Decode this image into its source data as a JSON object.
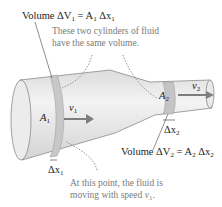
{
  "diagram": {
    "top_label": {
      "prefix": "Volume ΔV",
      "sub": "1",
      "eq": " = A",
      "sub2": "1",
      "tail": " Δx",
      "sub3": "1"
    },
    "top_note": [
      "These two cylinders of fluid",
      "have the same volume."
    ],
    "area_1": {
      "text": "A",
      "sub": "1"
    },
    "area_2": {
      "text": "A",
      "sub": "2"
    },
    "velocity_1": {
      "text": "v",
      "sub": "1"
    },
    "velocity_2": {
      "text": "v",
      "sub": "2"
    },
    "dx_1": {
      "text": "Δx",
      "sub": "1"
    },
    "dx_2": {
      "text": "Δx",
      "sub": "2"
    },
    "bottom_label": {
      "prefix": "Volume ΔV",
      "sub": "2",
      "eq": " = A",
      "sub2": "2",
      "tail": " Δx",
      "sub3": "2"
    },
    "bottom_note": [
      "At this point, the fluid is",
      "moving with speed "
    ],
    "bottom_note_var": {
      "text": "v",
      "sub": "1"
    },
    "colors": {
      "pipe": "#e6e6e6",
      "pipe_edge": "#8a8a8a",
      "slice": "#c8c8c8",
      "arrow": "#7d7d7d",
      "note": "#7a7a7a"
    }
  }
}
